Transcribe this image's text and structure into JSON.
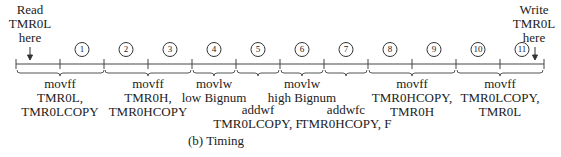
{
  "annotations": {
    "read": {
      "line1": "Read",
      "line2": "TMR0L",
      "line3": "here"
    },
    "write": {
      "line1": "Write",
      "line2": "TMR0L",
      "line3": "here"
    }
  },
  "cycles": [
    "1",
    "2",
    "3",
    "4",
    "5",
    "6",
    "7",
    "8",
    "9",
    "10",
    "11"
  ],
  "instructions": [
    {
      "line1": "movff",
      "line2": "TMR0L,",
      "line3": "TMR0LCOPY"
    },
    {
      "line1": "movff",
      "line2": "TMR0H,",
      "line3": "TMR0HCOPY"
    },
    {
      "line1": "movlw",
      "line2": "low Bignum"
    },
    {
      "line1": "addwf",
      "line2": "TMR0LCOPY, F"
    },
    {
      "line1": "movlw",
      "line2": "high Bignum"
    },
    {
      "line1": "addwfc",
      "line2": "TMR0HCOPY, F"
    },
    {
      "line1": "movff",
      "line2": "TMR0HCOPY,",
      "line3": "TMR0H"
    },
    {
      "line1": "movff",
      "line2": "TMR0LCOPY,",
      "line3": "TMR0L"
    }
  ],
  "caption": "(b) Timing",
  "colors": {
    "line": "#444444",
    "text": "#222222"
  }
}
